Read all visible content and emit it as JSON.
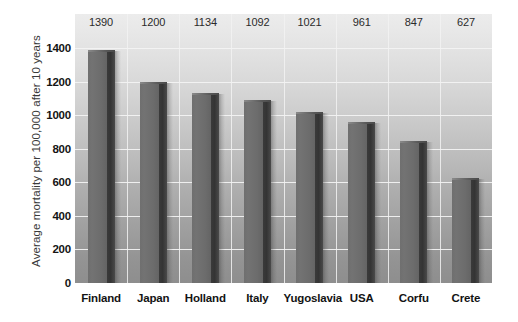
{
  "chart_data": {
    "type": "bar",
    "title": "",
    "subtitle": "",
    "xlabel": "",
    "ylabel": "Average mortality per 100,000 after 10 years",
    "categories": [
      "Finland",
      "Japan",
      "Holland",
      "Italy",
      "Yugoslavia",
      "USA",
      "Corfu",
      "Crete"
    ],
    "values": [
      1390,
      1200,
      1134,
      1092,
      1021,
      961,
      847,
      627
    ],
    "data_labels": [
      "1390",
      "1200",
      "1134",
      "1092",
      "1021",
      "961",
      "847",
      "627"
    ],
    "ylim": [
      0,
      1400
    ],
    "yticks": [
      0,
      200,
      400,
      600,
      800,
      1000,
      1200,
      1400
    ],
    "ytick_labels": [
      "0",
      "200",
      "400",
      "600",
      "800",
      "1000",
      "1200",
      "1400"
    ],
    "grid": "horizontal-and-vertical",
    "legend": "none",
    "series": [
      {
        "name": "Average mortality",
        "values": [
          1390,
          1200,
          1134,
          1092,
          1021,
          961,
          847,
          627
        ]
      }
    ],
    "colors": {
      "bar_face": "#6f6f6f",
      "bar_shadow": "#383838",
      "grid": "#f4f4f4",
      "background_top": "#ececec",
      "background_bottom": "#8e8e8e",
      "text": "#131313"
    }
  }
}
